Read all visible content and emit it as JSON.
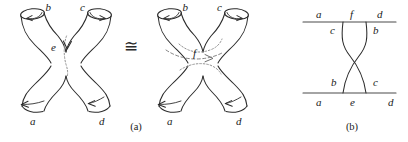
{
  "figure": {
    "caption_a": "(a)",
    "caption_b": "(b)",
    "relation_symbol": "≅"
  },
  "panel_a": {
    "name": "homeomorphic-surfaces",
    "surface_left": {
      "name": "surface-with-vertical-cut",
      "legs": {
        "top_left": "b",
        "top_right": "c",
        "bottom_left": "a",
        "bottom_right": "d"
      },
      "interior_curve_label": "e",
      "interior_curve_orientation": "vertical",
      "interior_arrow_direction": "down",
      "rim_arrows": {
        "top_left": "counterclockwise",
        "top_right": "clockwise",
        "bottom_left": "left",
        "bottom_right": "left"
      }
    },
    "surface_right": {
      "name": "surface-with-horizontal-cut",
      "legs": {
        "top_left": "b",
        "top_right": "c",
        "bottom_left": "a",
        "bottom_right": "d"
      },
      "interior_curve_label": "f",
      "interior_curve_orientation": "horizontal",
      "interior_arrow_direction": "right",
      "rim_arrows": {
        "top_left": "counterclockwise",
        "top_right": "clockwise",
        "bottom_left": "left",
        "bottom_right": "left"
      }
    }
  },
  "panel_b": {
    "name": "bowtie-graph",
    "top_edge": {
      "above_labels": [
        "a",
        "f",
        "d"
      ],
      "below_labels": [
        "c",
        "b"
      ]
    },
    "bottom_edge": {
      "above_labels": [
        "b",
        "c"
      ],
      "below_labels": [
        "a",
        "e",
        "d"
      ]
    },
    "crossing": "x-crossing"
  },
  "colors": {
    "ink": "#2b2b2b",
    "hidden_line": "#8c8c8c",
    "dashed_line": "#7d7d7d",
    "rule": "#4a4a4a",
    "background": "#ffffff"
  }
}
